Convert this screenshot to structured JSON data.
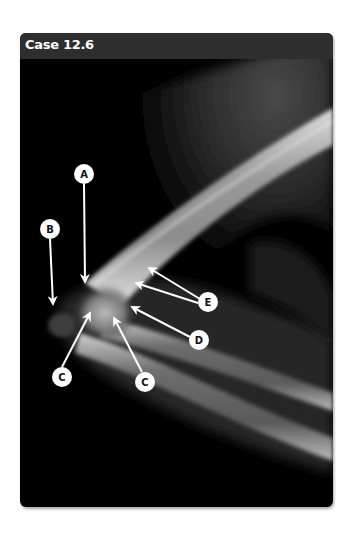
{
  "figure": {
    "title": "Case 12.6",
    "image_description": "Lateral radiograph of the elbow showing distal humerus, radius and ulna",
    "annotations": [
      {
        "id": "A",
        "label": "A"
      },
      {
        "id": "B",
        "label": "B"
      },
      {
        "id": "C1",
        "label": "C"
      },
      {
        "id": "C2",
        "label": "C"
      },
      {
        "id": "D",
        "label": "D"
      },
      {
        "id": "E",
        "label": "E"
      }
    ],
    "colors": {
      "header_bg": "#2e2e2e",
      "image_bg": "#000000",
      "label_fill": "#ffffff",
      "arrow_color": "#ffffff"
    }
  }
}
